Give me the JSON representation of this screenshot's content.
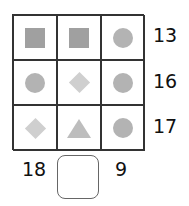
{
  "puzzle": {
    "grid": [
      [
        "square",
        "square",
        "circle"
      ],
      [
        "circle",
        "diamond",
        "circle"
      ],
      [
        "diamond",
        "triangle",
        "circle"
      ]
    ],
    "row_sums": [
      "13",
      "16",
      "17"
    ],
    "column_sums": [
      "18",
      "",
      "9"
    ],
    "answer_box": {
      "value": "",
      "column": 2
    },
    "colors": {
      "square": "#a0a0a0",
      "circle": "#b3b3b3",
      "diamond": "#cfcfcf",
      "triangle": "#bdbdbd",
      "grid_line": "#333333"
    }
  }
}
